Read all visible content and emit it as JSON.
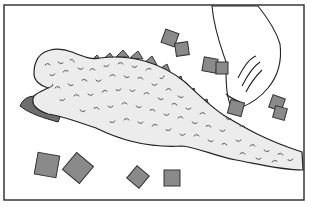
{
  "illustration": {
    "subject": "hand placing felt squares onto a fabric dinosaur shape",
    "colors": {
      "background": "#ffffff",
      "frame": "#2a2a2a",
      "line": "#222222",
      "fabric_fill": "#ececec",
      "fabric_texture": "#555555",
      "felt_square": "#8a8a8a",
      "felt_edge": "#333333",
      "underlay": "#6e6e6e"
    },
    "loose_squares": [
      {
        "x": 170,
        "y": 38,
        "size": 14,
        "rotate": 20
      },
      {
        "x": 182,
        "y": 49,
        "size": 13,
        "rotate": -8
      },
      {
        "x": 210,
        "y": 65,
        "size": 14,
        "rotate": 10
      },
      {
        "x": 222,
        "y": 68,
        "size": 12,
        "rotate": 0
      },
      {
        "x": 236,
        "y": 108,
        "size": 14,
        "rotate": 15
      },
      {
        "x": 277,
        "y": 103,
        "size": 13,
        "rotate": 20
      },
      {
        "x": 280,
        "y": 113,
        "size": 12,
        "rotate": 15
      },
      {
        "x": 47,
        "y": 165,
        "size": 22,
        "rotate": 10
      },
      {
        "x": 78,
        "y": 168,
        "size": 22,
        "rotate": 40
      },
      {
        "x": 138,
        "y": 177,
        "size": 16,
        "rotate": 40
      },
      {
        "x": 172,
        "y": 178,
        "size": 16,
        "rotate": 0
      }
    ]
  }
}
